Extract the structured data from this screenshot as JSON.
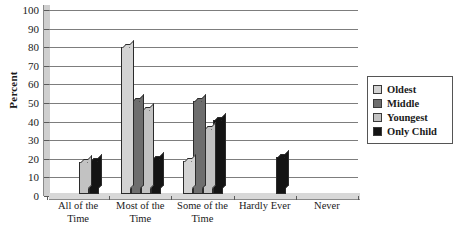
{
  "chart_data": {
    "type": "bar",
    "title": "",
    "xlabel": "",
    "ylabel": "Percent",
    "ylim": [
      0,
      100
    ],
    "yticks": [
      0,
      10,
      20,
      30,
      40,
      50,
      60,
      70,
      80,
      90,
      100
    ],
    "grid": true,
    "legend_position": "right",
    "categories": [
      "All of the Time",
      "Most of the Time",
      "Some of the Time",
      "Hardly Ever",
      "Never"
    ],
    "series": [
      {
        "name": "Oldest",
        "color": "#d3d3d3",
        "values": [
          0,
          79,
          18,
          0,
          0
        ]
      },
      {
        "name": "Middle",
        "color": "#6e6e6e",
        "values": [
          0,
          50,
          50,
          0,
          0
        ]
      },
      {
        "name": "Youngest",
        "color": "#c2c2c2",
        "values": [
          17,
          45,
          35,
          0,
          0
        ]
      },
      {
        "name": "Only Child",
        "color": "#141414",
        "values": [
          18,
          19,
          40,
          20,
          0
        ]
      }
    ]
  },
  "axis": {
    "y_title": "Percent",
    "y_tick_labels": [
      "0",
      "10",
      "20",
      "30",
      "40",
      "50",
      "60",
      "70",
      "80",
      "90",
      "100"
    ],
    "x_tick_labels": [
      "All of the Time",
      "Most of the\nTime",
      "Some of the\nTime",
      "Hardly Ever",
      "Never"
    ]
  },
  "legend": {
    "entries": [
      {
        "label": "Oldest",
        "color": "#d3d3d3"
      },
      {
        "label": "Middle",
        "color": "#6e6e6e"
      },
      {
        "label": "Youngest",
        "color": "#c2c2c2"
      },
      {
        "label": "Only Child",
        "color": "#141414"
      }
    ]
  }
}
